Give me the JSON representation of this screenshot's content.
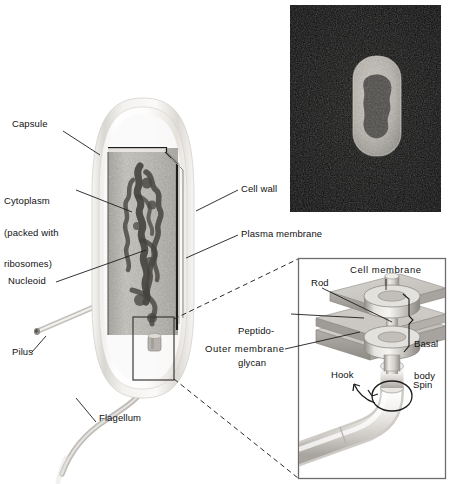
{
  "figure": {
    "background_color": "#ffffff",
    "width": 452,
    "height": 484
  },
  "main_diagram": {
    "name": "bacterial-cell-cutaway",
    "description": "Rod-shaped bacterium drawn in cutaway showing capsule, cell wall, plasma membrane, granular cytoplasm and dark nucleoid, with one pilus and one flagellum.",
    "labels": [
      {
        "id": "capsule",
        "text": "Capsule",
        "x": 12,
        "y": 124,
        "lines": [
          "Capsule"
        ]
      },
      {
        "id": "cytoplasm",
        "text": "Cytoplasm (packed with ribosomes)",
        "x": 4,
        "y": 180,
        "lines": [
          "Cytoplasm",
          "(packed with",
          "ribosomes)"
        ]
      },
      {
        "id": "nucleoid",
        "text": "Nucleoid",
        "x": 10,
        "y": 279,
        "lines": [
          "Nucleoid"
        ]
      },
      {
        "id": "pilus",
        "text": "Pilus",
        "x": 14,
        "y": 355,
        "lines": [
          "Pilus"
        ]
      },
      {
        "id": "flagellum",
        "text": "Flagellum",
        "x": 100,
        "y": 418,
        "lines": [
          "Flagellum"
        ]
      },
      {
        "id": "cell-wall",
        "text": "Cell wall",
        "x": 240,
        "y": 186,
        "lines": [
          "Cell wall"
        ]
      },
      {
        "id": "plasma-membrane",
        "text": "Plasma membrane",
        "x": 240,
        "y": 231,
        "lines": [
          "Plasma membrane"
        ]
      }
    ]
  },
  "micrograph": {
    "name": "electron-micrograph",
    "description": "Transmission electron micrograph of a rod-shaped bacterium, light cell body on black background with dark nucleoid region",
    "background_color": "#0a0a0a",
    "cell_color": "#b9b7b0",
    "nucleoid_color": "#4a4a48",
    "x": 290,
    "y": 5,
    "width": 151,
    "height": 207
  },
  "inset": {
    "name": "flagellar-motor-detail",
    "title": "Flagellar basal body detail",
    "border_color": "#6d6d6d",
    "x": 298,
    "y": 258,
    "width": 148,
    "height": 221,
    "labels": [
      {
        "id": "cell-membrane",
        "text": "Cell membrane",
        "x": 352,
        "y": 270,
        "lines": [
          "Cell membrane"
        ]
      },
      {
        "id": "rod",
        "text": "Rod",
        "x": 310,
        "y": 283,
        "lines": [
          "Rod"
        ]
      },
      {
        "id": "peptidoglycan",
        "text": "Peptido-glycan",
        "x": 240,
        "y": 310,
        "lines": [
          "Peptido-",
          "glycan"
        ]
      },
      {
        "id": "basal-body",
        "text": "Basal body",
        "x": 414,
        "y": 323,
        "lines": [
          "Basal",
          "body"
        ]
      },
      {
        "id": "outer-membrane",
        "text": "Outer membrane",
        "x": 206,
        "y": 348,
        "lines": [
          "Outer membrane"
        ]
      },
      {
        "id": "hook",
        "text": "Hook",
        "x": 332,
        "y": 375,
        "lines": [
          "Hook"
        ]
      },
      {
        "id": "spin",
        "text": "Spin",
        "x": 414,
        "y": 385,
        "lines": [
          "Spin"
        ]
      }
    ],
    "callout_box": {
      "x": 133,
      "y": 317,
      "width": 41,
      "height": 63
    }
  },
  "colors": {
    "line": "#111111",
    "capsule_outer": "#d8d6d2",
    "capsule_inner": "#f1efec",
    "cytoplasm": "#b0aea6",
    "nucleoid": "#53514c",
    "wall_dark": "#2a2a2a",
    "inset_fill": "#c9c7c2"
  }
}
